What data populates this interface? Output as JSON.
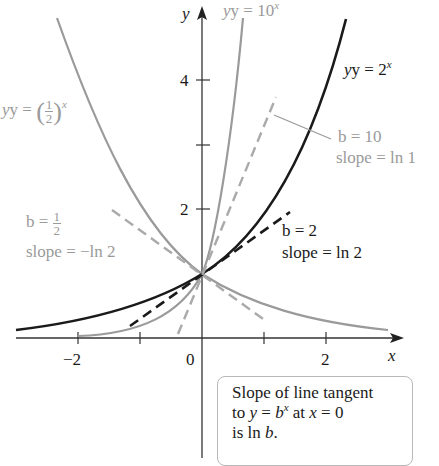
{
  "figure": {
    "axes": {
      "x_label": "x",
      "y_label": "y",
      "x_ticks": [
        {
          "value": -2,
          "label": "−2"
        },
        {
          "value": -1,
          "label": ""
        },
        {
          "value": 0,
          "label": "0"
        },
        {
          "value": 1,
          "label": ""
        },
        {
          "value": 2,
          "label": "2"
        }
      ],
      "y_ticks": [
        {
          "value": 2,
          "label": "2"
        },
        {
          "value": 3,
          "label": ""
        },
        {
          "value": 4,
          "label": "4"
        }
      ]
    },
    "curves": [
      {
        "name": "y = 10^x",
        "label_text": "y = 10",
        "label_exp": "x",
        "color": "#9a9a9a"
      },
      {
        "name": "y = 2^x",
        "label_text": "y = 2",
        "label_exp": "x",
        "color": "#1a1a1a"
      },
      {
        "name": "y = (1/2)^x",
        "label_prefix": "y = ",
        "frac_num": "1",
        "frac_den": "2",
        "label_exp": "x",
        "color": "#9a9a9a"
      }
    ],
    "tangents": {
      "b10": {
        "b_label": "b = 10",
        "slope_label": "slope = ln 1",
        "color": "#aaaaaa"
      },
      "b2": {
        "b_label": "b = 2",
        "slope_label": "slope = ln 2",
        "color": "#1a1a1a"
      },
      "bhalf": {
        "b_prefix": "b = ",
        "frac_num": "1",
        "frac_den": "2",
        "slope_label": "slope = −ln 2",
        "color": "#aaaaaa"
      }
    },
    "note": {
      "line1": "Slope of line tangent",
      "line2_a": "to ",
      "line2_b": "y",
      "line2_c": " = ",
      "line2_d": "b",
      "line2_e": "x",
      "line2_f": " at ",
      "line2_g": "x",
      "line2_h": " = 0",
      "line3_a": "is ln ",
      "line3_b": "b",
      "line3_c": "."
    }
  }
}
